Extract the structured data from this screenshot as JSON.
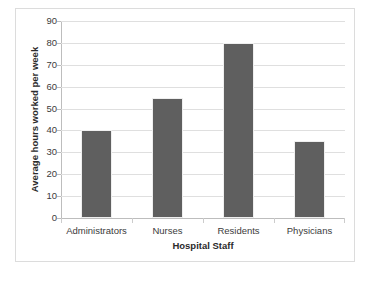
{
  "chart_data": {
    "type": "bar",
    "title": "",
    "subtitle": "",
    "xlabel": "Hospital Staff",
    "ylabel": "Average hours worked per week",
    "categories": [
      "Administrators",
      "Nurses",
      "Residents",
      "Physicians"
    ],
    "values": [
      40,
      55,
      80,
      35
    ],
    "ylim": [
      0,
      90
    ],
    "ytick_step": 10,
    "yticks": [
      "0",
      "10",
      "20",
      "30",
      "40",
      "50",
      "60",
      "70",
      "80",
      "90"
    ],
    "grid": "horizontal",
    "legend": "none",
    "bar_color": "#5f5f5f",
    "gridline_color": "#dfdfdf",
    "axis_color": "#bdbdbd",
    "frame_color": "#dcdcdc",
    "background_color": "#ffffff",
    "annotations": []
  }
}
